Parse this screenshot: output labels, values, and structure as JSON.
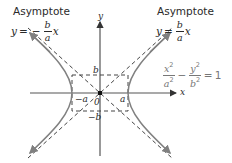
{
  "diagram": {
    "left_asymptote": {
      "caption": "Asymptote",
      "lhs": "y",
      "eq": "=",
      "sign": "−",
      "frac_num": "b",
      "frac_den": "a",
      "rhs": "x"
    },
    "right_asymptote": {
      "caption": "Asymptote",
      "lhs": "y",
      "eq": "=",
      "frac_num": "b",
      "frac_den": "a",
      "rhs": "x"
    },
    "hyperbola_equation": {
      "term1_num": "x",
      "term1_num_exp": "2",
      "term1_den": "a",
      "term1_den_exp": "2",
      "minus": "−",
      "term2_num": "y",
      "term2_num_exp": "2",
      "term2_den": "b",
      "term2_den_exp": "2",
      "eq": "=",
      "rhs": "1"
    },
    "axis_labels": {
      "x": "x",
      "y": "y"
    },
    "point_labels": {
      "b": "b",
      "neg_b": "−b",
      "neg_a": "−a",
      "a": "a",
      "origin": "0"
    },
    "colors": {
      "curve": "#808080",
      "axis": "#555555",
      "dashed": "#444444",
      "text": "#2a2a2a",
      "equation": "#777777"
    }
  }
}
